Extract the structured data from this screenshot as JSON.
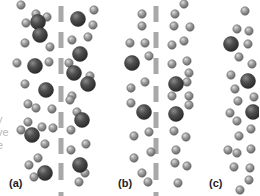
{
  "figure": {
    "colors": {
      "large_particle": "#4a4a4a",
      "small_particle": "#9a9a9a",
      "membrane": "#a8a8a8",
      "clipped_text": "#b8b8b8"
    },
    "clipped_text_lines": [
      "y",
      "ve",
      "e"
    ],
    "panels": [
      {
        "label": "(a)",
        "membrane": true,
        "large": [
          [
            38,
            22
          ],
          [
            78,
            19
          ],
          [
            40,
            35
          ],
          [
            80,
            54
          ],
          [
            35,
            66
          ],
          [
            74,
            73
          ],
          [
            46,
            90
          ],
          [
            88,
            84
          ],
          [
            32,
            135
          ],
          [
            82,
            120
          ],
          [
            45,
            173
          ],
          [
            80,
            165
          ]
        ],
        "small": [
          [
            21,
            5
          ],
          [
            36,
            14
          ],
          [
            47,
            17
          ],
          [
            26,
            23
          ],
          [
            94,
            10
          ],
          [
            93,
            25
          ],
          [
            25,
            43
          ],
          [
            50,
            47
          ],
          [
            72,
            40
          ],
          [
            88,
            37
          ],
          [
            17,
            63
          ],
          [
            49,
            62
          ],
          [
            69,
            63
          ],
          [
            90,
            76
          ],
          [
            25,
            84
          ],
          [
            72,
            96
          ],
          [
            70,
            100
          ],
          [
            28,
            104
          ],
          [
            36,
            108
          ],
          [
            52,
            109
          ],
          [
            77,
            112
          ],
          [
            28,
            122
          ],
          [
            42,
            127
          ],
          [
            53,
            128
          ],
          [
            71,
            130
          ],
          [
            21,
            130
          ],
          [
            45,
            144
          ],
          [
            71,
            150
          ],
          [
            86,
            144
          ],
          [
            38,
            158
          ],
          [
            29,
            165
          ],
          [
            85,
            173
          ],
          [
            34,
            177
          ],
          [
            79,
            182
          ]
        ]
      },
      {
        "label": "(b)",
        "membrane": true,
        "large": [
          [
            132,
            63
          ],
          [
            176,
            84
          ],
          [
            144,
            112
          ],
          [
            176,
            114
          ]
        ],
        "small": [
          [
            184,
            4
          ],
          [
            142,
            14
          ],
          [
            175,
            14
          ],
          [
            142,
            26
          ],
          [
            174,
            26
          ],
          [
            190,
            27
          ],
          [
            130,
            43
          ],
          [
            145,
            43
          ],
          [
            172,
            45
          ],
          [
            184,
            41
          ],
          [
            149,
            56
          ],
          [
            172,
            64
          ],
          [
            187,
            61
          ],
          [
            189,
            73
          ],
          [
            187,
            82
          ],
          [
            131,
            88
          ],
          [
            145,
            82
          ],
          [
            172,
            96
          ],
          [
            131,
            103
          ],
          [
            189,
            105
          ],
          [
            189,
            96
          ],
          [
            134,
            136
          ],
          [
            149,
            132
          ],
          [
            174,
            131
          ],
          [
            186,
            137
          ],
          [
            151,
            152
          ],
          [
            176,
            150
          ],
          [
            134,
            158
          ],
          [
            175,
            163
          ],
          [
            187,
            166
          ],
          [
            142,
            173
          ],
          [
            148,
            182
          ],
          [
            178,
            183
          ]
        ]
      },
      {
        "label": "(c)",
        "membrane": false,
        "large": [
          [
            231,
            44
          ],
          [
            248,
            81
          ],
          [
            253,
            112
          ]
        ],
        "small": [
          [
            245,
            11
          ],
          [
            237,
            29
          ],
          [
            249,
            31
          ],
          [
            248,
            44
          ],
          [
            239,
            57
          ],
          [
            252,
            64
          ],
          [
            231,
            75
          ],
          [
            235,
            89
          ],
          [
            238,
            101
          ],
          [
            254,
            97
          ],
          [
            230,
            113
          ],
          [
            237,
            121
          ],
          [
            251,
            129
          ],
          [
            239,
            136
          ],
          [
            228,
            150
          ],
          [
            237,
            153
          ],
          [
            251,
            149
          ],
          [
            234,
            167
          ],
          [
            250,
            168
          ],
          [
            249,
            180
          ],
          [
            240,
            190
          ]
        ]
      }
    ]
  }
}
